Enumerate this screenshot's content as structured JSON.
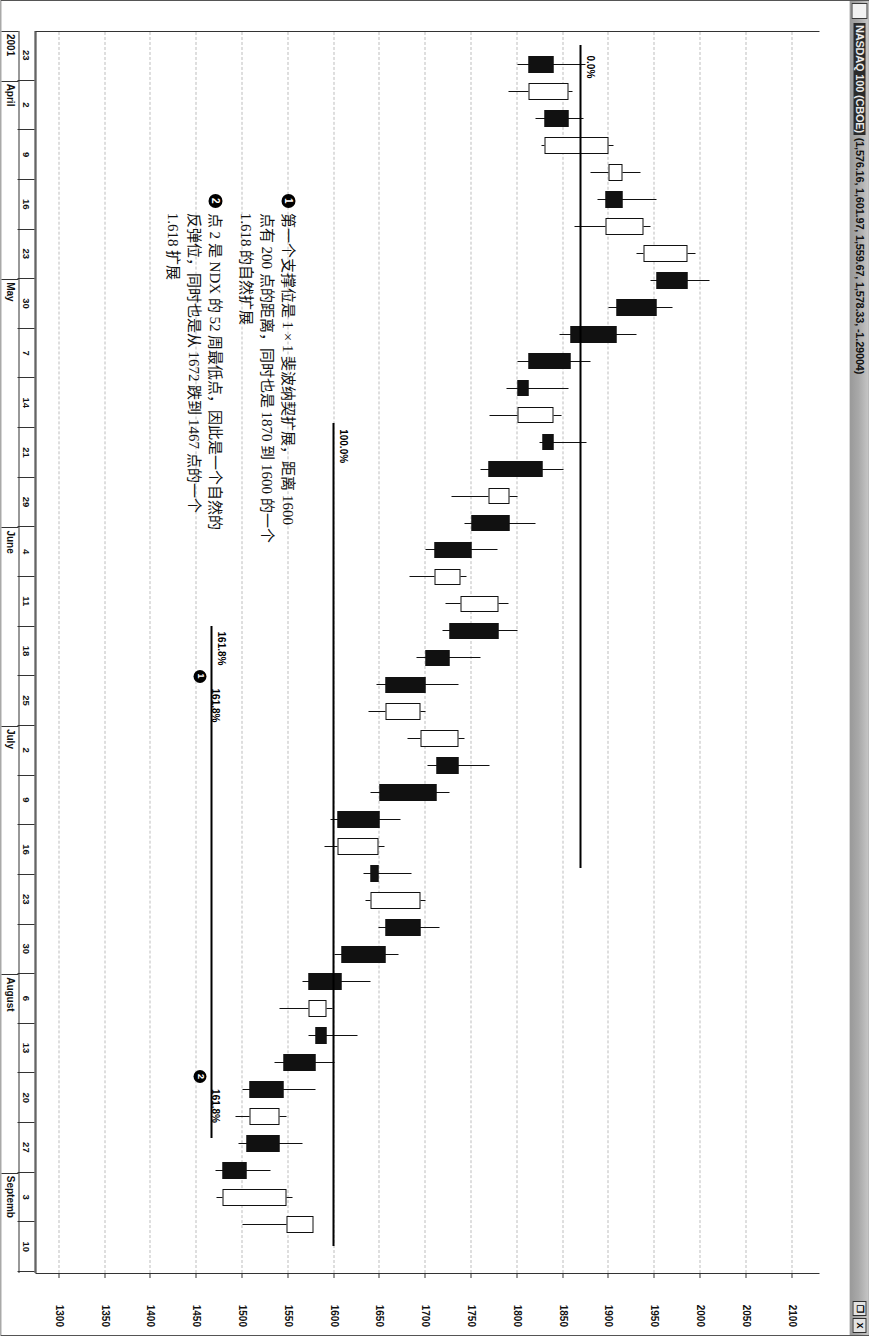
{
  "window": {
    "title_symbol": "NASDAQ 100 (CBOE)",
    "title_quote": "(1,576.16, 1,601.97, 1,559.67, 1,578.33, -1.29004)",
    "system_menu_icon": "system-menu-icon",
    "restore_button_label": "❐",
    "close_button_label": "X"
  },
  "chart_data": {
    "type": "candlestick",
    "title": "NASDAQ 100 (CBOE) (1,576.16, 1,601.97, 1,559.67, 1,578.33, -1.29004)",
    "xlabel": "",
    "ylabel": "",
    "ylim": [
      1275,
      2130
    ],
    "grid": true,
    "legend": "none",
    "y_ticks": [
      2100,
      2050,
      2000,
      1950,
      1900,
      1850,
      1800,
      1750,
      1700,
      1650,
      1600,
      1550,
      1500,
      1450,
      1400,
      1350,
      1300
    ],
    "x_tick_labels": [
      "23",
      "2",
      "9",
      "16",
      "23",
      "30",
      "7",
      "14",
      "21",
      "29",
      "4",
      "11",
      "18",
      "25",
      "2",
      "9",
      "16",
      "23",
      "30",
      "6",
      "13",
      "20",
      "27",
      "3",
      "10"
    ],
    "x_month_labels": [
      {
        "label": "2001",
        "index": 0
      },
      {
        "label": "April",
        "index": 1
      },
      {
        "label": "May",
        "index": 5
      },
      {
        "label": "June",
        "index": 10
      },
      {
        "label": "July",
        "index": 14
      },
      {
        "label": "August",
        "index": 19
      },
      {
        "label": "Septemb",
        "index": 23
      }
    ],
    "series_name": "NDX weekly",
    "candles": [
      {
        "t": 0,
        "o": 1840,
        "h": 1875,
        "l": 1800,
        "c": 1812,
        "dir": "down"
      },
      {
        "t": 1,
        "o": 1812,
        "h": 1860,
        "l": 1790,
        "c": 1856,
        "dir": "up"
      },
      {
        "t": 2,
        "o": 1856,
        "h": 1872,
        "l": 1820,
        "c": 1830,
        "dir": "down"
      },
      {
        "t": 3,
        "o": 1830,
        "h": 1905,
        "l": 1826,
        "c": 1900,
        "dir": "up"
      },
      {
        "t": 4,
        "o": 1900,
        "h": 1935,
        "l": 1880,
        "c": 1915,
        "dir": "up"
      },
      {
        "t": 5,
        "o": 1915,
        "h": 1952,
        "l": 1888,
        "c": 1896,
        "dir": "down"
      },
      {
        "t": 6,
        "o": 1896,
        "h": 1945,
        "l": 1862,
        "c": 1938,
        "dir": "up"
      },
      {
        "t": 7,
        "o": 1938,
        "h": 1995,
        "l": 1930,
        "c": 1986,
        "dir": "up"
      },
      {
        "t": 8,
        "o": 1986,
        "h": 2010,
        "l": 1945,
        "c": 1952,
        "dir": "down"
      },
      {
        "t": 9,
        "o": 1952,
        "h": 1970,
        "l": 1900,
        "c": 1908,
        "dir": "down"
      },
      {
        "t": 10,
        "o": 1908,
        "h": 1930,
        "l": 1846,
        "c": 1858,
        "dir": "down"
      },
      {
        "t": 11,
        "o": 1858,
        "h": 1880,
        "l": 1800,
        "c": 1812,
        "dir": "down"
      },
      {
        "t": 12,
        "o": 1812,
        "h": 1856,
        "l": 1788,
        "c": 1800,
        "dir": "down"
      },
      {
        "t": 13,
        "o": 1800,
        "h": 1848,
        "l": 1770,
        "c": 1840,
        "dir": "up"
      },
      {
        "t": 14,
        "o": 1840,
        "h": 1876,
        "l": 1824,
        "c": 1828,
        "dir": "down"
      },
      {
        "t": 15,
        "o": 1828,
        "h": 1850,
        "l": 1760,
        "c": 1768,
        "dir": "down"
      },
      {
        "t": 16,
        "o": 1768,
        "h": 1800,
        "l": 1728,
        "c": 1792,
        "dir": "up"
      },
      {
        "t": 17,
        "o": 1792,
        "h": 1820,
        "l": 1742,
        "c": 1750,
        "dir": "down"
      },
      {
        "t": 18,
        "o": 1750,
        "h": 1778,
        "l": 1700,
        "c": 1710,
        "dir": "down"
      },
      {
        "t": 19,
        "o": 1710,
        "h": 1745,
        "l": 1682,
        "c": 1738,
        "dir": "up"
      },
      {
        "t": 20,
        "o": 1738,
        "h": 1790,
        "l": 1722,
        "c": 1780,
        "dir": "up"
      },
      {
        "t": 21,
        "o": 1780,
        "h": 1800,
        "l": 1718,
        "c": 1726,
        "dir": "down"
      },
      {
        "t": 22,
        "o": 1726,
        "h": 1760,
        "l": 1690,
        "c": 1700,
        "dir": "down"
      },
      {
        "t": 23,
        "o": 1700,
        "h": 1736,
        "l": 1646,
        "c": 1656,
        "dir": "down"
      },
      {
        "t": 24,
        "o": 1656,
        "h": 1700,
        "l": 1638,
        "c": 1694,
        "dir": "up"
      },
      {
        "t": 25,
        "o": 1694,
        "h": 1742,
        "l": 1680,
        "c": 1736,
        "dir": "up"
      },
      {
        "t": 26,
        "o": 1736,
        "h": 1770,
        "l": 1702,
        "c": 1712,
        "dir": "down"
      },
      {
        "t": 27,
        "o": 1712,
        "h": 1726,
        "l": 1640,
        "c": 1650,
        "dir": "down"
      },
      {
        "t": 28,
        "o": 1650,
        "h": 1672,
        "l": 1596,
        "c": 1604,
        "dir": "down"
      },
      {
        "t": 29,
        "o": 1604,
        "h": 1655,
        "l": 1590,
        "c": 1648,
        "dir": "up"
      },
      {
        "t": 30,
        "o": 1648,
        "h": 1685,
        "l": 1632,
        "c": 1640,
        "dir": "down"
      },
      {
        "t": 31,
        "o": 1640,
        "h": 1700,
        "l": 1634,
        "c": 1694,
        "dir": "up"
      },
      {
        "t": 32,
        "o": 1694,
        "h": 1715,
        "l": 1648,
        "c": 1656,
        "dir": "down"
      },
      {
        "t": 33,
        "o": 1656,
        "h": 1670,
        "l": 1600,
        "c": 1608,
        "dir": "down"
      },
      {
        "t": 34,
        "o": 1608,
        "h": 1640,
        "l": 1566,
        "c": 1572,
        "dir": "down"
      },
      {
        "t": 35,
        "o": 1572,
        "h": 1598,
        "l": 1540,
        "c": 1592,
        "dir": "up"
      },
      {
        "t": 36,
        "o": 1592,
        "h": 1625,
        "l": 1572,
        "c": 1580,
        "dir": "down"
      },
      {
        "t": 37,
        "o": 1580,
        "h": 1600,
        "l": 1535,
        "c": 1545,
        "dir": "down"
      },
      {
        "t": 38,
        "o": 1545,
        "h": 1580,
        "l": 1500,
        "c": 1508,
        "dir": "down"
      },
      {
        "t": 39,
        "o": 1508,
        "h": 1548,
        "l": 1492,
        "c": 1540,
        "dir": "up"
      },
      {
        "t": 40,
        "o": 1540,
        "h": 1565,
        "l": 1496,
        "c": 1504,
        "dir": "down"
      },
      {
        "t": 41,
        "o": 1504,
        "h": 1530,
        "l": 1470,
        "c": 1478,
        "dir": "down"
      },
      {
        "t": 42,
        "o": 1478,
        "h": 1555,
        "l": 1472,
        "c": 1548,
        "dir": "up"
      },
      {
        "t": 43,
        "o": 1548,
        "h": 1560,
        "l": 1500,
        "c": 1578,
        "dir": "up"
      }
    ],
    "fib_levels": [
      {
        "label": "0.0%",
        "value": 1870
      },
      {
        "label": "100.0%",
        "value": 1600
      },
      {
        "label": "161.8%",
        "value": 1467
      }
    ],
    "fib_markers": [
      {
        "id": "1",
        "label": "161.8%",
        "value": 1467
      },
      {
        "id": "2",
        "label": "161.8%",
        "value": 1467
      }
    ]
  },
  "annotations": [
    {
      "id": "1",
      "bullet": "❶",
      "text": "第一个支撑位是 1 × 1 斐波纳契扩展，距离 1600 点有 200 点的距离，同时也是 1870 到 1600 的一个 1.618 的自然扩展"
    },
    {
      "id": "2",
      "bullet": "❷",
      "text": "点 2 是 NDX 的 52 周最低点，因此是一个自然的反弹位，同时也是从 1672 跌到 1467 点的一个 1.618 扩展"
    }
  ]
}
